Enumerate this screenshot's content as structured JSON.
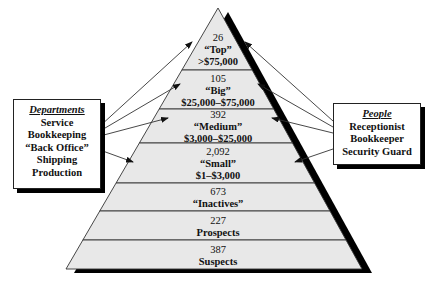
{
  "pyramid": {
    "tiers": [
      {
        "count": "26",
        "name": "“Top”",
        "range": ">$75,000"
      },
      {
        "count": "105",
        "name": "“Big”",
        "range": "$25,000–$75,000"
      },
      {
        "count": "392",
        "name": "“Medium”",
        "range": "$3,000–$25,000"
      },
      {
        "count": "2,092",
        "name": "“Small”",
        "range": "$1–$3,000"
      },
      {
        "count": "673",
        "name": "“Inactives”",
        "range": ""
      },
      {
        "count": "227",
        "name": "Prospects",
        "range": ""
      },
      {
        "count": "387",
        "name": "Suspects",
        "range": ""
      }
    ],
    "colors": {
      "fill": "#e8e8e8",
      "stroke": "#333333",
      "shadow": "#000000"
    }
  },
  "departments": {
    "heading": "Departments",
    "items": [
      "Service",
      "Bookkeeping",
      "“Back Office”",
      "Shipping",
      "Production"
    ]
  },
  "people": {
    "heading": "People",
    "items": [
      "Receptionist",
      "Bookkeeper",
      "Security Guard"
    ]
  }
}
